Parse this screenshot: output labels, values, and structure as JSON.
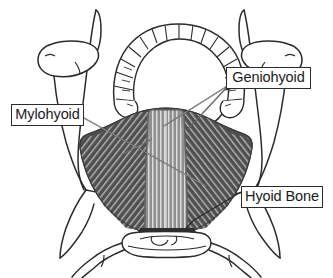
{
  "figure": {
    "background_color": "#ffffff",
    "outline_color": "#2b2b2b",
    "width": 333,
    "height": 278
  },
  "labels": [
    {
      "id": "mylohyoid",
      "text": "Mylohyoid",
      "box": {
        "x": 11,
        "y": 104,
        "w": 73,
        "h": 22
      },
      "leader_from": {
        "x": 84,
        "y": 122
      },
      "leader_to": {
        "x": 206,
        "y": 185
      },
      "border_color": "#2b2b2b",
      "text_color": "#1a1a1a"
    },
    {
      "id": "geniohyoid",
      "text": "Geniohyoid",
      "box": {
        "x": 226,
        "y": 67,
        "w": 85,
        "h": 22
      },
      "leader_from": {
        "x": 226,
        "y": 86
      },
      "leader_to": {
        "x": 166,
        "y": 126
      },
      "border_color": "#2b2b2b",
      "text_color": "#1a1a1a"
    },
    {
      "id": "hyoid-bone",
      "text": "Hyoid Bone",
      "box": {
        "x": 241,
        "y": 186,
        "w": 82,
        "h": 22
      },
      "leader_from": {
        "x": 241,
        "y": 192
      },
      "leader_to": {
        "x": 193,
        "y": 216
      },
      "border_color": "#2b2b2b",
      "text_color": "#1a1a1a"
    }
  ],
  "structures": [
    {
      "id": "mandible",
      "name": "Mandible with dental arch",
      "fill": "#ffffff",
      "stroke": "#2b2b2b",
      "teeth_count": 16
    },
    {
      "id": "mylohyoid-muscle",
      "name": "Mylohyoid muscle",
      "fill": "#4f4f4f",
      "striation_color": "#b9b9b9",
      "striation_direction": "diagonal"
    },
    {
      "id": "geniohyoid-muscle",
      "name": "Geniohyoid muscle",
      "fill": "#9a9a9a",
      "striation_color": "#e2e2e2",
      "striation_direction": "vertical"
    },
    {
      "id": "hyoid-bone",
      "name": "Hyoid bone",
      "fill": "#ffffff",
      "stroke": "#2b2b2b"
    },
    {
      "id": "ramus-left",
      "name": "Left mandibular ramus and condyle",
      "fill": "#ffffff",
      "stroke": "#2b2b2b"
    },
    {
      "id": "ramus-right",
      "name": "Right mandibular ramus and condyle",
      "fill": "#ffffff",
      "stroke": "#2b2b2b"
    }
  ],
  "colors": {
    "line": "#2b2b2b",
    "muscle_dark": "#4f4f4f",
    "muscle_light": "#9a9a9a",
    "background": "#ffffff"
  }
}
